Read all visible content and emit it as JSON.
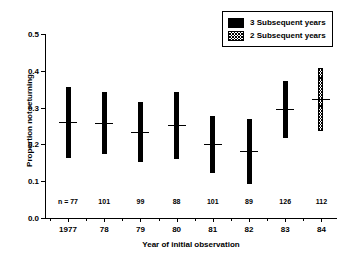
{
  "chart_data": {
    "type": "bar",
    "title": "",
    "xlabel": "Year of initial observation",
    "ylabel": "Proportion not returning",
    "categories": [
      "1977",
      "78",
      "79",
      "80",
      "81",
      "82",
      "83",
      "84"
    ],
    "ylim": [
      0.0,
      0.5
    ],
    "ytick_labels": [
      "0.0",
      "0.1",
      "0.2",
      "0.3",
      "0.4",
      "0.5"
    ],
    "ytick_values": [
      0.0,
      0.1,
      0.2,
      0.3,
      0.4,
      0.5
    ],
    "grid": false,
    "legend_position": "top-right",
    "legend": [
      {
        "label": "3 Subsequent years",
        "pattern": "solid"
      },
      {
        "label": "2 Subsequent years",
        "pattern": "hatched"
      }
    ],
    "series": [
      {
        "name": "3 Subsequent years",
        "pattern": "solid",
        "points": [
          {
            "category": "1977",
            "n_label": "n = 77",
            "n": 77,
            "mean": 0.26,
            "low": 0.163,
            "high": 0.357
          },
          {
            "category": "78",
            "n_label": "101",
            "n": 101,
            "mean": 0.259,
            "low": 0.174,
            "high": 0.342
          },
          {
            "category": "79",
            "n_label": "99",
            "n": 99,
            "mean": 0.233,
            "low": 0.153,
            "high": 0.315
          },
          {
            "category": "80",
            "n_label": "88",
            "n": 88,
            "mean": 0.252,
            "low": 0.161,
            "high": 0.342
          },
          {
            "category": "81",
            "n_label": "101",
            "n": 101,
            "mean": 0.2,
            "low": 0.123,
            "high": 0.278
          },
          {
            "category": "82",
            "n_label": "89",
            "n": 89,
            "mean": 0.181,
            "low": 0.092,
            "high": 0.27
          },
          {
            "category": "83",
            "n_label": "126",
            "n": 126,
            "mean": 0.297,
            "low": 0.217,
            "high": 0.373
          }
        ]
      },
      {
        "name": "2 Subsequent years",
        "pattern": "hatched",
        "points": [
          {
            "category": "84",
            "n_label": "112",
            "n": 112,
            "mean": 0.323,
            "low": 0.237,
            "high": 0.408
          }
        ]
      }
    ]
  },
  "colors": {
    "axis": "#000000",
    "solid_bar": "#000000",
    "hatched_bar": "#000000",
    "background": "#ffffff"
  }
}
